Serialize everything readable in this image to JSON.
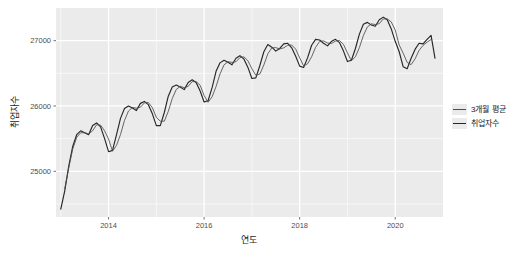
{
  "chart_data": {
    "type": "line",
    "title": "",
    "xlabel": "연도",
    "ylabel": "취업자수",
    "xlim": [
      2012.9,
      2021.0
    ],
    "ylim": [
      24300,
      27500
    ],
    "xticks": [
      2014,
      2016,
      2018,
      2020
    ],
    "xtick_labels": [
      "2014",
      "2016",
      "2018",
      "2020"
    ],
    "yticks": [
      25000,
      26000,
      27000
    ],
    "ytick_labels": [
      "25000",
      "26000",
      "27000"
    ],
    "grid": true,
    "grid_color": "#ffffff",
    "panel_color": "#ebebeb",
    "legend_position": "right",
    "legend": [
      "3개월 평균",
      "취업자수"
    ],
    "series": [
      {
        "name": "취업자수",
        "color": "#262626",
        "x": [
          2013.0,
          2013.083,
          2013.167,
          2013.25,
          2013.333,
          2013.417,
          2013.5,
          2013.583,
          2013.667,
          2013.75,
          2013.833,
          2013.917,
          2014.0,
          2014.083,
          2014.167,
          2014.25,
          2014.333,
          2014.417,
          2014.5,
          2014.583,
          2014.667,
          2014.75,
          2014.833,
          2014.917,
          2015.0,
          2015.083,
          2015.167,
          2015.25,
          2015.333,
          2015.417,
          2015.5,
          2015.583,
          2015.667,
          2015.75,
          2015.833,
          2015.917,
          2016.0,
          2016.083,
          2016.167,
          2016.25,
          2016.333,
          2016.417,
          2016.5,
          2016.583,
          2016.667,
          2016.75,
          2016.833,
          2016.917,
          2017.0,
          2017.083,
          2017.167,
          2017.25,
          2017.333,
          2017.417,
          2017.5,
          2017.583,
          2017.667,
          2017.75,
          2017.833,
          2017.917,
          2018.0,
          2018.083,
          2018.167,
          2018.25,
          2018.333,
          2018.417,
          2018.5,
          2018.583,
          2018.667,
          2018.75,
          2018.833,
          2018.917,
          2019.0,
          2019.083,
          2019.167,
          2019.25,
          2019.333,
          2019.417,
          2019.5,
          2019.583,
          2019.667,
          2019.75,
          2019.833,
          2019.917,
          2020.0,
          2020.083,
          2020.167,
          2020.25,
          2020.333,
          2020.417,
          2020.5,
          2020.583,
          2020.667,
          2020.75,
          2020.833
        ],
        "y": [
          24420,
          24700,
          25080,
          25380,
          25560,
          25620,
          25590,
          25560,
          25700,
          25740,
          25680,
          25500,
          25300,
          25320,
          25560,
          25810,
          25960,
          26000,
          25970,
          25930,
          26040,
          26070,
          26020,
          25880,
          25700,
          25700,
          25900,
          26150,
          26290,
          26320,
          26290,
          26250,
          26360,
          26400,
          26360,
          26230,
          26060,
          26080,
          26280,
          26530,
          26660,
          26700,
          26670,
          26630,
          26730,
          26770,
          26720,
          26590,
          26420,
          26430,
          26620,
          26830,
          26940,
          26900,
          26840,
          26880,
          26950,
          26960,
          26890,
          26760,
          26610,
          26590,
          26740,
          26930,
          27020,
          27010,
          26960,
          26920,
          26990,
          27020,
          26970,
          26840,
          26680,
          26700,
          26880,
          27100,
          27250,
          27280,
          27240,
          27220,
          27320,
          27360,
          27320,
          27180,
          26990,
          26830,
          26600,
          26570,
          26730,
          26870,
          26960,
          26950,
          27020,
          27080,
          26730
        ]
      },
      {
        "name": "3개월 평균",
        "color": "#4d4d4d",
        "x": [
          2013.083,
          2013.167,
          2013.25,
          2013.333,
          2013.417,
          2013.5,
          2013.583,
          2013.667,
          2013.75,
          2013.833,
          2013.917,
          2014.0,
          2014.083,
          2014.167,
          2014.25,
          2014.333,
          2014.417,
          2014.5,
          2014.583,
          2014.667,
          2014.75,
          2014.833,
          2014.917,
          2015.0,
          2015.083,
          2015.167,
          2015.25,
          2015.333,
          2015.417,
          2015.5,
          2015.583,
          2015.667,
          2015.75,
          2015.833,
          2015.917,
          2016.0,
          2016.083,
          2016.167,
          2016.25,
          2016.333,
          2016.417,
          2016.5,
          2016.583,
          2016.667,
          2016.75,
          2016.833,
          2016.917,
          2017.0,
          2017.083,
          2017.167,
          2017.25,
          2017.333,
          2017.417,
          2017.5,
          2017.583,
          2017.667,
          2017.75,
          2017.833,
          2017.917,
          2018.0,
          2018.083,
          2018.167,
          2018.25,
          2018.333,
          2018.417,
          2018.5,
          2018.583,
          2018.667,
          2018.75,
          2018.833,
          2018.917,
          2019.0,
          2019.083,
          2019.167,
          2019.25,
          2019.333,
          2019.417,
          2019.5,
          2019.583,
          2019.667,
          2019.75,
          2019.833,
          2019.917,
          2020.0,
          2020.083,
          2020.167,
          2020.25,
          2020.333,
          2020.417,
          2020.5,
          2020.583,
          2020.667,
          2020.75
        ],
        "y": [
          24733,
          25053,
          25340,
          25520,
          25590,
          25590,
          25573,
          25620,
          25713,
          25707,
          25620,
          25493,
          25307,
          25397,
          25563,
          25777,
          25923,
          25977,
          25967,
          25980,
          26047,
          26053,
          25973,
          25827,
          25767,
          25767,
          25917,
          26113,
          26253,
          26300,
          26280,
          26300,
          26373,
          26373,
          26317,
          26160,
          26057,
          26140,
          26297,
          26490,
          26630,
          26677,
          26667,
          26677,
          26740,
          26753,
          26693,
          26570,
          26470,
          26490,
          26627,
          26797,
          26890,
          26893,
          26873,
          26890,
          26930,
          26933,
          26870,
          26737,
          26613,
          26647,
          26753,
          26897,
          26987,
          26997,
          26963,
          26957,
          26993,
          27003,
          26943,
          26813,
          26693,
          26753,
          26893,
          27077,
          27210,
          27257,
          27247,
          27260,
          27333,
          27333,
          27287,
          27163,
          26933,
          26807,
          26667,
          26633,
          26723,
          26853,
          26927,
          26977,
          27017
        ]
      }
    ]
  },
  "axes": {
    "y_title": "취업자수",
    "x_title": "연도",
    "y_tick_0": "25000",
    "y_tick_1": "26000",
    "y_tick_2": "27000",
    "x_tick_0": "2014",
    "x_tick_1": "2016",
    "x_tick_2": "2018",
    "x_tick_3": "2020"
  },
  "legend": {
    "item_0": "3개월 평균",
    "item_1": "취업자수"
  },
  "caption": {
    "text": ""
  },
  "colors": {
    "panel": "#ebebeb",
    "grid": "#ffffff",
    "series_moving_average": "#4d4d4d",
    "series_employment": "#262626",
    "tick_label": "#4d4d4d",
    "axis_title": "#1a1a1a"
  }
}
